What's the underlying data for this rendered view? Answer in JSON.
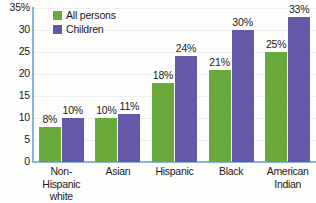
{
  "chart_data": {
    "type": "bar",
    "title": "",
    "xlabel": "",
    "ylabel": "",
    "ylim": [
      0,
      35
    ],
    "grid": true,
    "legend_position": "top-left",
    "categories": [
      "Non-Hispanic white",
      "Asian",
      "Hispanic",
      "Black",
      "American Indian"
    ],
    "category_lines": [
      [
        "Non-Hispanic",
        "white"
      ],
      [
        "Asian",
        ""
      ],
      [
        "Hispanic",
        ""
      ],
      [
        "Black",
        ""
      ],
      [
        "American",
        "Indian"
      ]
    ],
    "series": [
      {
        "name": "All persons",
        "color": "#6aaa3c",
        "values": [
          8,
          10,
          18,
          21,
          25
        ],
        "labels": [
          "8%",
          "10%",
          "18%",
          "21%",
          "25%"
        ]
      },
      {
        "name": "Children",
        "color": "#6658a8",
        "values": [
          10,
          11,
          24,
          30,
          33
        ],
        "labels": [
          "10%",
          "11%",
          "24%",
          "30%",
          "33%"
        ]
      }
    ],
    "yticks": [
      35,
      30,
      25,
      20,
      15,
      10,
      5,
      0
    ],
    "ytick_labels": [
      "35%",
      "30",
      "25",
      "20",
      "15",
      "10",
      "5",
      "0"
    ]
  },
  "legend": {
    "items": [
      {
        "label": "All persons",
        "color": "#6aaa3c",
        "swatch": "legend-swatch-green"
      },
      {
        "label": "Children",
        "color": "#6658a8",
        "swatch": "legend-swatch-purple"
      }
    ]
  },
  "axis": {
    "line_color": "#8ab4d8",
    "grid_color": "#eceff1"
  }
}
